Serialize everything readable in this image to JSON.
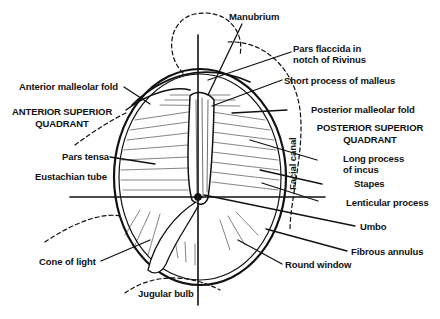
{
  "diagram": {
    "colors": {
      "ink": "#111111",
      "background": "#ffffff"
    },
    "labels": {
      "manubrium": "Manubrium",
      "pars_flaccida_1": "Pars flaccida in",
      "pars_flaccida_2": "notch of Rivinus",
      "short_process": "Short process of malleus",
      "anterior_malleolar_fold": "Anterior malleolar fold",
      "posterior_malleolar_fold": "Posterior malleolar fold",
      "anterior_superior_quadrant_1": "ANTERIOR SUPERIOR",
      "anterior_superior_quadrant_2": "QUADRANT",
      "posterior_superior_quadrant_1": "POSTERIOR SUPERIOR",
      "posterior_superior_quadrant_2": "QUADRANT",
      "pars_tensa": "Pars tensa",
      "eustachian_tube": "Eustachian tube",
      "long_process_1": "Long process",
      "long_process_2": "of incus",
      "facial_canal": "Facial canal",
      "stapes": "Stapes",
      "lenticular_process": "Lenticular process",
      "umbo": "Umbo",
      "fibrous_annulus": "Fibrous annulus",
      "round_window": "Round window",
      "cone_of_light": "Cone of light",
      "jugular_bulb": "Jugular bulb"
    }
  }
}
